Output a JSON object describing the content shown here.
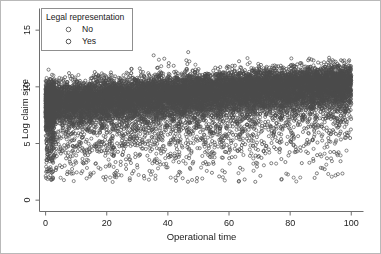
{
  "chart_data": {
    "type": "scatter",
    "title": "",
    "xlabel": "Operational time",
    "ylabel": "Log claim size",
    "xlim": [
      -2,
      104
    ],
    "ylim": [
      -1,
      17
    ],
    "xticks": [
      0,
      20,
      40,
      60,
      80,
      100
    ],
    "yticks": [
      0,
      5,
      10,
      15
    ],
    "grid": false,
    "legend": {
      "position": "top-left",
      "title": "Legal representation",
      "entries": [
        {
          "label": "No",
          "marker": "open-circle",
          "color": "#6b6b6b"
        },
        {
          "label": "Yes",
          "marker": "open-circle",
          "color": "#555555"
        }
      ]
    },
    "series": [
      {
        "name": "No",
        "marker": "open-circle",
        "color": "#5a5a5a",
        "n_points": 8200,
        "trend_intercept": 8.55,
        "trend_slope": 0.0175,
        "band_sd_upper": 0.78,
        "band_sd_lower": 1.55,
        "tail_fraction": 0.16
      },
      {
        "name": "Yes",
        "marker": "open-circle",
        "color": "#4a4a4a",
        "n_points": 8200,
        "trend_intercept": 8.72,
        "trend_slope": 0.0168,
        "band_sd_upper": 0.8,
        "band_sd_lower": 1.5,
        "tail_fraction": 0.16
      }
    ],
    "axis_color": "#6e6e6e",
    "frame_color": "#b9b9b9",
    "background": "#ffffff"
  }
}
